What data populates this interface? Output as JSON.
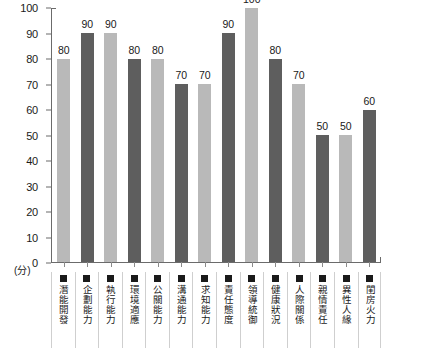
{
  "chart_data": {
    "type": "bar",
    "title": "",
    "xlabel": "",
    "ylabel": "(分)",
    "ylim": [
      0,
      100
    ],
    "y_ticks": [
      100,
      90,
      80,
      70,
      60,
      50,
      40,
      30,
      20,
      10,
      0
    ],
    "grid": false,
    "legend": "none",
    "categories": [
      "潛能開發",
      "企劃能力",
      "執行能力",
      "環境適應",
      "公關能力",
      "溝通能力",
      "求知能力",
      "責任態度",
      "領導統御",
      "健康狀況",
      "人際關係",
      "親情責任",
      "異性人緣",
      "閨房火力"
    ],
    "values": [
      80,
      90,
      90,
      80,
      80,
      70,
      70,
      90,
      100,
      80,
      70,
      50,
      50,
      60
    ],
    "bar_shades": [
      "light",
      "dark",
      "light",
      "dark",
      "light",
      "dark",
      "light",
      "dark",
      "light",
      "dark",
      "light",
      "dark",
      "light",
      "dark"
    ],
    "colors": {
      "bar_light": "#b9b9b9",
      "bar_dark": "#5e5e5e",
      "axis": "#6b6b6b",
      "text": "#1a1a1a",
      "divider": "#cfcfcf",
      "background": "#ffffff"
    },
    "marker_icon": "filled-square-marker"
  }
}
